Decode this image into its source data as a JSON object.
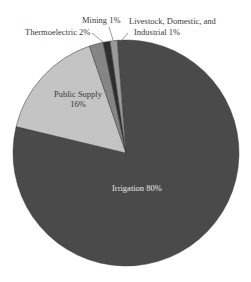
{
  "chart_data": {
    "type": "pie",
    "title": "",
    "slices": [
      {
        "label": "Irrigation",
        "value": 80,
        "display": "Irrigation 80%",
        "color": "#4a4a4a"
      },
      {
        "label": "Public Supply",
        "value": 16,
        "display": "Public Supply 16%",
        "color": "#c4c4c4"
      },
      {
        "label": "Thermoelectric",
        "value": 2,
        "display": "Thermoelectric 2%",
        "color": "#858585"
      },
      {
        "label": "Mining",
        "value": 1,
        "display": "Mining 1%",
        "color": "#2e2e2e"
      },
      {
        "label": "Livestock, Domestic, and Industrial",
        "value": 1,
        "display": "Livestock, Domestic, and Industrial 1%",
        "color": "#9a9a9a"
      }
    ],
    "legend": "none (direct labels)",
    "units": "%"
  },
  "labels": {
    "irrigation": "Irrigation 80%",
    "public_supply_line1": "Public Supply",
    "public_supply_line2": "16%",
    "thermoelectric": "Thermoelectric 2%",
    "mining": "Mining 1%",
    "livestock_line1": "Livestock, Domestic, and",
    "livestock_line2": "Industrial 1%"
  }
}
